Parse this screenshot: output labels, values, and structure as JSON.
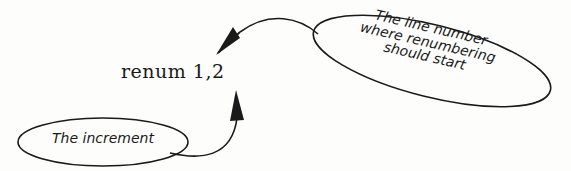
{
  "diagram": {
    "command": {
      "text": "renum 1,2",
      "keyword": "renum",
      "arguments": [
        "1",
        "2"
      ]
    },
    "annotations": [
      {
        "id": "start-line",
        "lines": [
          "The line number",
          "where renumbering",
          "should start"
        ],
        "points_to": "1"
      },
      {
        "id": "increment",
        "lines": [
          "The increment"
        ],
        "points_to": "2"
      }
    ],
    "colors": {
      "ink": "#1a1a1a",
      "paper": "#fdfdfb"
    }
  }
}
